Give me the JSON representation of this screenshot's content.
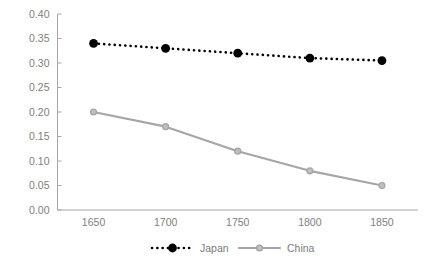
{
  "chart_data": {
    "type": "line",
    "title": "",
    "subtitle": "",
    "xlabel": "",
    "ylabel": "",
    "x": [
      1650,
      1700,
      1750,
      1800,
      1850
    ],
    "categories": [
      "1650",
      "1700",
      "1750",
      "1800",
      "1850"
    ],
    "xtick_labels": [
      "1650",
      "1700",
      "1750",
      "1800",
      "1850"
    ],
    "ytick_labels": [
      "0.00",
      "0.05",
      "0.10",
      "0.15",
      "0.20",
      "0.25",
      "0.30",
      "0.35",
      "0.40"
    ],
    "ytick_values": [
      0.0,
      0.05,
      0.1,
      0.15,
      0.2,
      0.25,
      0.3,
      0.35,
      0.4
    ],
    "ylim": [
      0.0,
      0.4
    ],
    "xlim": [
      1625,
      1875
    ],
    "grid": false,
    "legend_position": "bottom",
    "series": [
      {
        "name": "Japan",
        "values": [
          0.34,
          0.33,
          0.32,
          0.31,
          0.305
        ],
        "color": "#000000",
        "line_style": "dotted",
        "marker": "filled-circle"
      },
      {
        "name": "China",
        "values": [
          0.2,
          0.17,
          0.12,
          0.08,
          0.05
        ],
        "color": "#a6a6a6",
        "line_style": "solid",
        "marker": "open-circle"
      }
    ]
  },
  "legend": {
    "items": [
      {
        "label": "Japan",
        "color": "#000000",
        "style": "dotted"
      },
      {
        "label": "China",
        "color": "#a6a6a6",
        "style": "solid"
      }
    ]
  },
  "colors": {
    "japan": "#000000",
    "china": "#a6a6a6",
    "axis": "#a6a6a6",
    "tick_text": "#808080",
    "legend_text": "#7b7b7b",
    "background": "#ffffff"
  }
}
